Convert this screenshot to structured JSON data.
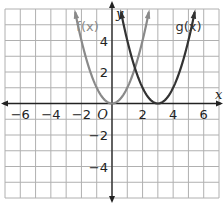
{
  "chart_data": {
    "type": "line",
    "title": "",
    "xlabel": "x",
    "ylabel": "y",
    "xlim": [
      -7,
      7
    ],
    "ylim": [
      -6,
      6
    ],
    "grid": true,
    "origin_label": "O",
    "x_ticks": [
      {
        "value": -6,
        "label": "−6"
      },
      {
        "value": -4,
        "label": "−4"
      },
      {
        "value": -2,
        "label": "−2"
      },
      {
        "value": 2,
        "label": "2"
      },
      {
        "value": 4,
        "label": "4"
      },
      {
        "value": 6,
        "label": "6"
      }
    ],
    "y_ticks": [
      {
        "value": 4,
        "label": "4"
      },
      {
        "value": 2,
        "label": "2"
      },
      {
        "value": -2,
        "label": "−2"
      },
      {
        "value": -4,
        "label": "−4"
      }
    ],
    "series": [
      {
        "name": "f(x)",
        "expression": "x^2",
        "vertex": [
          0,
          0
        ],
        "color": "#8a8a8a",
        "label": "f(x)",
        "label_pos": [
          -1.6,
          4.6
        ]
      },
      {
        "name": "g(x)",
        "expression": "(x-3)^2",
        "vertex": [
          3,
          0
        ],
        "color": "#333333",
        "label": "g(x)",
        "label_pos": [
          5.0,
          4.6
        ]
      }
    ]
  },
  "colors": {
    "grid": "#b0b0b0",
    "axis": "#222222"
  }
}
